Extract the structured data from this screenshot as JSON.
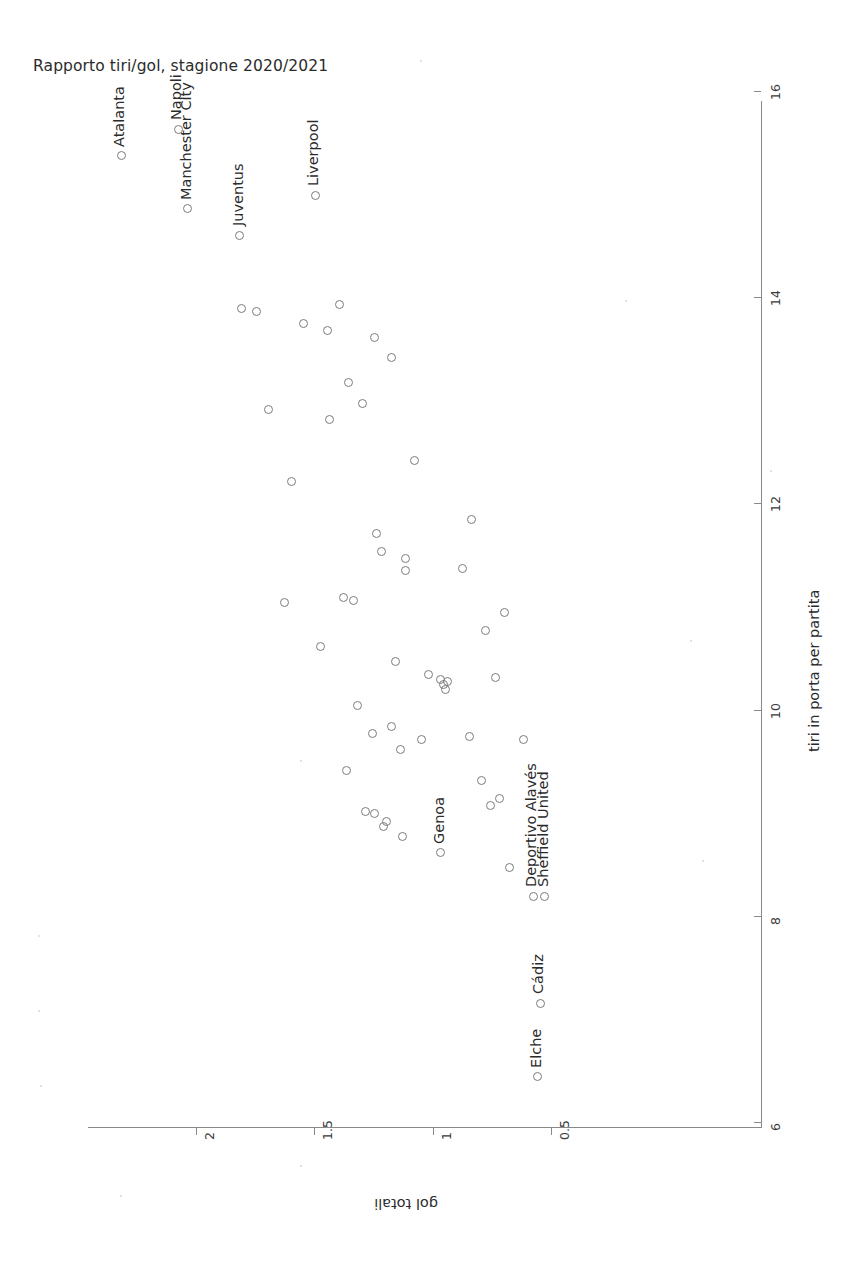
{
  "chart_data": {
    "type": "scatter",
    "title": "Rapporto tiri/gol, stagione 2020/2021",
    "xlabel": "gol totali",
    "ylabel": "tiri in porta per partita",
    "orientation": "rotated-90-ccw",
    "x_axis": {
      "name": "gol totali",
      "ticks": [
        "2",
        "1.5",
        "1",
        "0.5"
      ],
      "tick_values": [
        2,
        1.5,
        1,
        0.5
      ],
      "range": [
        2.45,
        0.42
      ],
      "direction": "decreasing-left-to-right"
    },
    "y_axis": {
      "name": "tiri in porta per partita",
      "ticks": [
        "6",
        "8",
        "10",
        "12",
        "14",
        "16"
      ],
      "tick_values": [
        6,
        8,
        10,
        12,
        14,
        16
      ],
      "range": [
        5.95,
        16.2
      ],
      "direction": "increasing-bottom-to-top"
    },
    "grid": false,
    "legend": false,
    "marker": "open-circle",
    "marker_color": "#7c7c7c",
    "labelled_points": [
      {
        "label": "Atalanta",
        "gol": 2.32,
        "tiri": 15.38
      },
      {
        "label": "Napoli",
        "gol": 2.08,
        "tiri": 15.64
      },
      {
        "label": "Manchester City",
        "gol": 2.04,
        "tiri": 14.87
      },
      {
        "label": "Juventus",
        "gol": 1.82,
        "tiri": 14.61
      },
      {
        "label": "Liverpool",
        "gol": 1.5,
        "tiri": 15.0
      },
      {
        "label": "Genoa",
        "gol": 0.97,
        "tiri": 8.62
      },
      {
        "label": "Deportivo Alavés",
        "gol": 0.58,
        "tiri": 8.2
      },
      {
        "label": "Sheffield United",
        "gol": 0.53,
        "tiri": 8.2
      },
      {
        "label": "Cádiz",
        "gol": 0.55,
        "tiri": 7.16
      },
      {
        "label": "Elche",
        "gol": 0.56,
        "tiri": 6.45
      }
    ],
    "unlabelled_points": [
      {
        "gol": 1.81,
        "tiri": 13.9
      },
      {
        "gol": 1.75,
        "tiri": 13.87
      },
      {
        "gol": 1.4,
        "tiri": 13.94
      },
      {
        "gol": 1.45,
        "tiri": 13.69
      },
      {
        "gol": 1.55,
        "tiri": 13.75
      },
      {
        "gol": 1.25,
        "tiri": 13.62
      },
      {
        "gol": 1.18,
        "tiri": 13.42
      },
      {
        "gol": 1.36,
        "tiri": 13.18
      },
      {
        "gol": 1.7,
        "tiri": 12.92
      },
      {
        "gol": 1.3,
        "tiri": 12.98
      },
      {
        "gol": 1.44,
        "tiri": 12.82
      },
      {
        "gol": 1.6,
        "tiri": 12.22
      },
      {
        "gol": 1.08,
        "tiri": 12.43
      },
      {
        "gol": 0.84,
        "tiri": 11.85
      },
      {
        "gol": 1.24,
        "tiri": 11.72
      },
      {
        "gol": 1.22,
        "tiri": 11.54
      },
      {
        "gol": 1.12,
        "tiri": 11.48
      },
      {
        "gol": 1.12,
        "tiri": 11.36
      },
      {
        "gol": 0.88,
        "tiri": 11.38
      },
      {
        "gol": 1.63,
        "tiri": 11.05
      },
      {
        "gol": 1.38,
        "tiri": 11.1
      },
      {
        "gol": 1.34,
        "tiri": 11.07
      },
      {
        "gol": 0.7,
        "tiri": 10.95
      },
      {
        "gol": 0.78,
        "tiri": 10.78
      },
      {
        "gol": 1.48,
        "tiri": 10.62
      },
      {
        "gol": 1.16,
        "tiri": 10.48
      },
      {
        "gol": 1.02,
        "tiri": 10.35
      },
      {
        "gol": 0.97,
        "tiri": 10.3
      },
      {
        "gol": 0.96,
        "tiri": 10.25
      },
      {
        "gol": 0.94,
        "tiri": 10.28
      },
      {
        "gol": 0.95,
        "tiri": 10.2
      },
      {
        "gol": 0.74,
        "tiri": 10.32
      },
      {
        "gol": 1.32,
        "tiri": 10.05
      },
      {
        "gol": 1.18,
        "tiri": 9.85
      },
      {
        "gol": 1.26,
        "tiri": 9.78
      },
      {
        "gol": 1.14,
        "tiri": 9.62
      },
      {
        "gol": 1.05,
        "tiri": 9.72
      },
      {
        "gol": 0.85,
        "tiri": 9.75
      },
      {
        "gol": 0.62,
        "tiri": 9.72
      },
      {
        "gol": 1.37,
        "tiri": 9.42
      },
      {
        "gol": 0.8,
        "tiri": 9.32
      },
      {
        "gol": 0.72,
        "tiri": 9.15
      },
      {
        "gol": 0.76,
        "tiri": 9.08
      },
      {
        "gol": 1.29,
        "tiri": 9.02
      },
      {
        "gol": 1.25,
        "tiri": 9.0
      },
      {
        "gol": 1.2,
        "tiri": 8.92
      },
      {
        "gol": 1.21,
        "tiri": 8.88
      },
      {
        "gol": 1.13,
        "tiri": 8.78
      },
      {
        "gol": 0.68,
        "tiri": 8.48
      }
    ]
  }
}
